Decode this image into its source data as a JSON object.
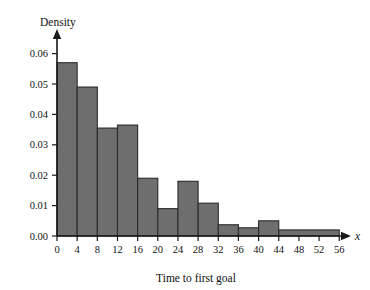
{
  "chart_data": {
    "type": "bar",
    "title": "",
    "subtitle": "",
    "xlabel": "Time to first goal",
    "ylabel": "Density",
    "x_axis_variable": "x",
    "xlim": [
      0,
      58
    ],
    "ylim": [
      0,
      0.063
    ],
    "grid": false,
    "legend": null,
    "bar_fill_color": "#6e6e6e",
    "bar_edge_color": "#2b2b2b",
    "axis_color": "#1a1a1a",
    "x_ticks": [
      "0",
      "4",
      "8",
      "12",
      "16",
      "20",
      "24",
      "28",
      "32",
      "36",
      "40",
      "44",
      "48",
      "52",
      "56"
    ],
    "x_tick_values": [
      0,
      4,
      8,
      12,
      16,
      20,
      24,
      28,
      32,
      36,
      40,
      44,
      48,
      52,
      56
    ],
    "y_ticks": [
      "0.00",
      "0.01",
      "0.02",
      "0.03",
      "0.04",
      "0.05",
      "0.06"
    ],
    "y_tick_values": [
      0.0,
      0.01,
      0.02,
      0.03,
      0.04,
      0.05,
      0.06
    ],
    "bins": [
      {
        "start": 0,
        "end": 4,
        "density": 0.057
      },
      {
        "start": 4,
        "end": 8,
        "density": 0.049
      },
      {
        "start": 8,
        "end": 12,
        "density": 0.0355
      },
      {
        "start": 12,
        "end": 16,
        "density": 0.0365
      },
      {
        "start": 16,
        "end": 20,
        "density": 0.019
      },
      {
        "start": 20,
        "end": 24,
        "density": 0.009
      },
      {
        "start": 24,
        "end": 28,
        "density": 0.018
      },
      {
        "start": 28,
        "end": 32,
        "density": 0.0108
      },
      {
        "start": 32,
        "end": 36,
        "density": 0.0037
      },
      {
        "start": 36,
        "end": 40,
        "density": 0.0027
      },
      {
        "start": 40,
        "end": 44,
        "density": 0.005
      },
      {
        "start": 44,
        "end": 56,
        "density": 0.002
      }
    ],
    "categories": [
      "0-4",
      "4-8",
      "8-12",
      "12-16",
      "16-20",
      "20-24",
      "24-28",
      "28-32",
      "32-36",
      "36-40",
      "40-44",
      "44-56"
    ],
    "values": [
      0.057,
      0.049,
      0.0355,
      0.0365,
      0.019,
      0.009,
      0.018,
      0.0108,
      0.0037,
      0.0027,
      0.005,
      0.002
    ]
  }
}
